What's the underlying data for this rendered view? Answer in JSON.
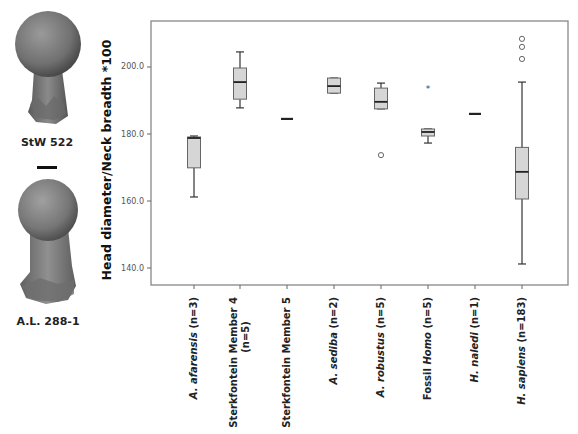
{
  "specimens": [
    {
      "label": "StW 522"
    },
    {
      "label": "A.L. 288-1"
    }
  ],
  "chart_data": {
    "type": "boxplot",
    "title": "",
    "ylabel": "Head diameter/Neck breadth *100",
    "xlabel": "",
    "ylim": [
      137,
      215
    ],
    "yticks": [
      140.0,
      160.0,
      180.0,
      200.0
    ],
    "ytick_labels": [
      "140.0",
      "160.0",
      "180.0",
      "200.0"
    ],
    "grid": false,
    "legend": null,
    "categories": [
      {
        "italic": "A. afarensis",
        "plain": " (n=3)",
        "line2": ""
      },
      {
        "italic": "",
        "plain": "Sterkfontein Member 4",
        "line2": "(n=5)"
      },
      {
        "italic": "",
        "plain": "Sterkfontein Member 5",
        "line2": ""
      },
      {
        "italic": "A. sediba",
        "plain": " (n=2)",
        "line2": ""
      },
      {
        "italic": "A. robustus",
        "plain": " (n=5)",
        "line2": ""
      },
      {
        "prefix": "Fossil ",
        "italic": "Homo",
        "plain": " (n=5)",
        "line2": ""
      },
      {
        "italic": "H. naledi",
        "plain": " (n=1)",
        "line2": ""
      },
      {
        "italic": "H. sapiens",
        "plain": " (n=183)",
        "line2": ""
      }
    ],
    "series": [
      {
        "name": "A. afarensis (n=3)",
        "min": 161.2,
        "q1": 169.9,
        "median": 178.8,
        "q3": 179.1,
        "max": 179.4,
        "outliers": [],
        "extremes": []
      },
      {
        "name": "Sterkfontein Member 4 (n=5)",
        "min": 187.8,
        "q1": 190.4,
        "median": 195.5,
        "q3": 199.7,
        "max": 204.5,
        "outliers": [],
        "extremes": []
      },
      {
        "name": "Sterkfontein Member 5",
        "single": 184.5
      },
      {
        "name": "A. sediba (n=2)",
        "min": 192.2,
        "q1": 192.2,
        "median": 194.3,
        "q3": 196.7,
        "max": 196.7,
        "outliers": [],
        "extremes": []
      },
      {
        "name": "A. robustus (n=5)",
        "min": 187.5,
        "q1": 187.5,
        "median": 189.6,
        "q3": 193.7,
        "max": 195.2,
        "outliers": [
          173.7
        ],
        "extremes": []
      },
      {
        "name": "Fossil Homo (n=5)",
        "min": 177.3,
        "q1": 179.4,
        "median": 180.6,
        "q3": 181.5,
        "max": 181.5,
        "outliers": [],
        "extremes": [
          193.7
        ]
      },
      {
        "name": "H. naledi (n=1)",
        "single": 186.0
      },
      {
        "name": "H. sapiens (n=183)",
        "min": 141.2,
        "q1": 160.6,
        "median": 168.7,
        "q3": 176.0,
        "max": 195.5,
        "outliers": [
          202.4,
          206.0,
          208.4
        ],
        "extremes": []
      }
    ]
  }
}
